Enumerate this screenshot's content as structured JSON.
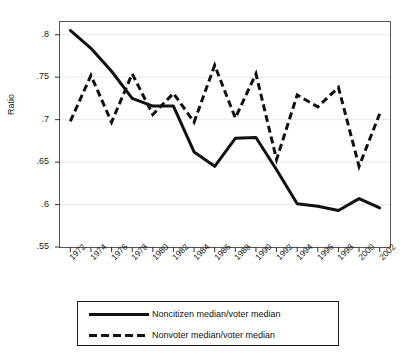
{
  "chart_data": {
    "type": "line",
    "title": "",
    "xlabel": "",
    "ylabel": "Ratio",
    "grid": true,
    "legend_position": "bottom-center",
    "xlim": [
      1972,
      2002
    ],
    "ylim": [
      0.55,
      0.815
    ],
    "yticks": [
      ".55",
      ".6",
      ".65",
      ".7",
      ".75",
      ".8"
    ],
    "ytick_values": [
      0.55,
      0.6,
      0.65,
      0.7,
      0.75,
      0.8
    ],
    "x": [
      1972,
      1974,
      1976,
      1978,
      1980,
      1982,
      1984,
      1986,
      1988,
      1990,
      1992,
      1994,
      1996,
      1998,
      2000,
      2002
    ],
    "xtick_labels": [
      "1972",
      "1974",
      "1976",
      "1978",
      "1980",
      "1982",
      "1984",
      "1986",
      "1988",
      "1990",
      "1992",
      "1994",
      "1996",
      "1998",
      "2000",
      "2002"
    ],
    "series": [
      {
        "name": "Noncitizen median/voter median",
        "style": "solid",
        "color": "#111111",
        "values": [
          0.805,
          0.784,
          0.757,
          0.725,
          0.716,
          0.716,
          0.662,
          0.645,
          0.678,
          0.679,
          0.641,
          0.601,
          0.598,
          0.593,
          0.607,
          0.596
        ]
      },
      {
        "name": "Nonvoter median/voter median",
        "style": "dashed",
        "color": "#111111",
        "values": [
          0.698,
          0.752,
          0.697,
          0.754,
          0.706,
          0.731,
          0.697,
          0.764,
          0.702,
          0.754,
          0.653,
          0.729,
          0.715,
          0.738,
          0.645,
          0.707
        ]
      }
    ]
  },
  "axis": {
    "ylabel": "Ratio"
  },
  "legend": {
    "items": [
      {
        "label": "Noncitizen median/voter median",
        "key": "solid-line-key"
      },
      {
        "label": "Nonvoter median/voter median",
        "key": "dashed-line-key"
      }
    ]
  }
}
